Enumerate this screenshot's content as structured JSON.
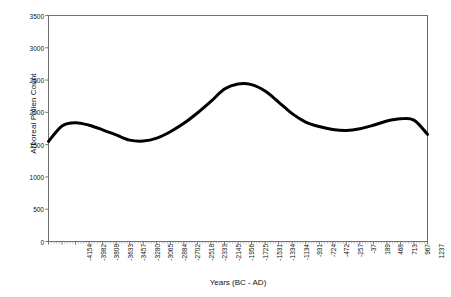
{
  "chart_data": {
    "type": "line",
    "title": "",
    "xlabel": "Years (BC - AD)",
    "ylabel": "Arboreal Pollen Count",
    "ylim": [
      0,
      3500
    ],
    "ytick_labels": [
      "0",
      "500",
      "1000",
      "1500",
      "2000",
      "2500",
      "3000",
      "3500"
    ],
    "ytick_values": [
      0,
      500,
      1000,
      1500,
      2000,
      2500,
      3000,
      3500
    ],
    "grid": false,
    "legend": "none",
    "line_color": "#000000",
    "line_width_px": 3,
    "categories": [
      "-4154",
      "-3982",
      "-3808",
      "-3633",
      "-3457",
      "-3280",
      "-3065",
      "-2884",
      "-2702",
      "-2518",
      "-2333",
      "-2145",
      "-1956",
      "-1725",
      "-1531",
      "-1334",
      "-1134",
      "-931",
      "-724",
      "-472",
      "-257",
      "-37",
      "189",
      "468",
      "713",
      "967",
      "1237",
      "1533",
      "1891"
    ],
    "values": [
      1550,
      1790,
      1840,
      1800,
      1730,
      1650,
      1570,
      1555,
      1600,
      1700,
      1830,
      1990,
      2170,
      2360,
      2440,
      2430,
      2330,
      2160,
      1980,
      1850,
      1780,
      1735,
      1720,
      1745,
      1800,
      1865,
      1900,
      1880,
      1660
    ]
  }
}
